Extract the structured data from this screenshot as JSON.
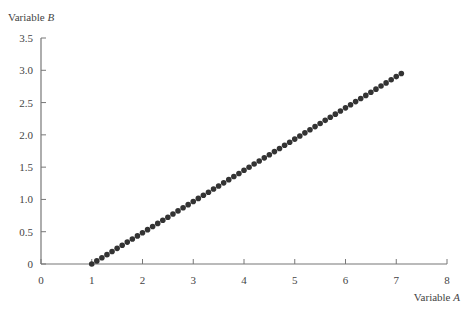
{
  "chart_data": {
    "type": "scatter",
    "title": "",
    "xlabel": "Variable A",
    "ylabel": "Variable B",
    "xlabel_parts": {
      "text": "Variable ",
      "italic": "A"
    },
    "ylabel_parts": {
      "text": "Variable ",
      "italic": "B"
    },
    "xlim": [
      0,
      8
    ],
    "ylim": [
      0,
      3.5
    ],
    "x_ticks": [
      "0",
      "1",
      "2",
      "3",
      "4",
      "5",
      "6",
      "7",
      "8"
    ],
    "y_ticks": [
      "0",
      "0.5",
      "1.0",
      "1.5",
      "2.0",
      "2.5",
      "3.0",
      "3.5"
    ],
    "grid": false,
    "legend": null,
    "marker_color": "#333333",
    "series": [
      {
        "name": "B vs A",
        "x_start": 1.0,
        "x_end": 7.1,
        "x_step": 0.1,
        "slope": 0.4836,
        "note": "61 points along line from (1.0, 0) to (7.1, 2.95)",
        "points": [
          [
            1.0,
            0.0
          ],
          [
            1.1,
            0.048
          ],
          [
            1.2,
            0.097
          ],
          [
            1.3,
            0.145
          ],
          [
            1.4,
            0.193
          ],
          [
            1.5,
            0.242
          ],
          [
            1.6,
            0.29
          ],
          [
            1.7,
            0.339
          ],
          [
            1.8,
            0.387
          ],
          [
            1.9,
            0.435
          ],
          [
            2.0,
            0.484
          ],
          [
            2.1,
            0.532
          ],
          [
            2.2,
            0.58
          ],
          [
            2.3,
            0.629
          ],
          [
            2.4,
            0.677
          ],
          [
            2.5,
            0.725
          ],
          [
            2.6,
            0.774
          ],
          [
            2.7,
            0.822
          ],
          [
            2.8,
            0.87
          ],
          [
            2.9,
            0.919
          ],
          [
            3.0,
            0.967
          ],
          [
            3.1,
            1.016
          ],
          [
            3.2,
            1.064
          ],
          [
            3.3,
            1.112
          ],
          [
            3.4,
            1.161
          ],
          [
            3.5,
            1.209
          ],
          [
            3.6,
            1.257
          ],
          [
            3.7,
            1.306
          ],
          [
            3.8,
            1.354
          ],
          [
            3.9,
            1.402
          ],
          [
            4.0,
            1.451
          ],
          [
            4.1,
            1.499
          ],
          [
            4.2,
            1.548
          ],
          [
            4.3,
            1.596
          ],
          [
            4.4,
            1.644
          ],
          [
            4.5,
            1.693
          ],
          [
            4.6,
            1.741
          ],
          [
            4.7,
            1.789
          ],
          [
            4.8,
            1.838
          ],
          [
            4.9,
            1.886
          ],
          [
            5.0,
            1.934
          ],
          [
            5.1,
            1.983
          ],
          [
            5.2,
            2.031
          ],
          [
            5.3,
            2.079
          ],
          [
            5.4,
            2.128
          ],
          [
            5.5,
            2.176
          ],
          [
            5.6,
            2.225
          ],
          [
            5.7,
            2.273
          ],
          [
            5.8,
            2.321
          ],
          [
            5.9,
            2.37
          ],
          [
            6.0,
            2.418
          ],
          [
            6.1,
            2.466
          ],
          [
            6.2,
            2.515
          ],
          [
            6.3,
            2.563
          ],
          [
            6.4,
            2.611
          ],
          [
            6.5,
            2.66
          ],
          [
            6.6,
            2.708
          ],
          [
            6.7,
            2.757
          ],
          [
            6.8,
            2.805
          ],
          [
            6.9,
            2.853
          ],
          [
            7.0,
            2.902
          ],
          [
            7.1,
            2.95
          ]
        ]
      }
    ]
  }
}
